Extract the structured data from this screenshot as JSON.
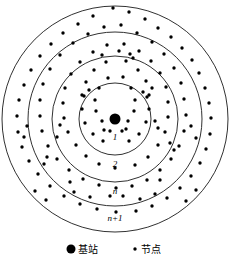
{
  "figure": {
    "title": "",
    "center": {
      "cx": 115,
      "cy": 119
    },
    "base_station": {
      "label": "base-station",
      "radius": 5.5,
      "color": "#000000"
    },
    "rings": [
      {
        "id": "ring-1",
        "radius": 36,
        "label": "1",
        "label_x": 115,
        "label_y": 140
      },
      {
        "id": "ring-2",
        "radius": 63,
        "label": "2",
        "label_x": 115,
        "label_y": 167
      },
      {
        "id": "ring-n",
        "radius": 87,
        "label": "n",
        "label_x": 115,
        "label_y": 194
      },
      {
        "id": "ring-n-plus-1",
        "radius": 113,
        "label": "n+1",
        "label_x": 115,
        "label_y": 221
      }
    ],
    "stroke_color": "#1a1a1a",
    "stroke_width": 0.9,
    "node": {
      "radius": 1.7,
      "color": "#000000"
    },
    "nodes": [
      [
        113,
        8
      ],
      [
        129,
        12
      ],
      [
        93,
        16
      ],
      [
        145,
        19
      ],
      [
        78,
        24
      ],
      [
        158,
        28
      ],
      [
        63,
        33
      ],
      [
        171,
        37
      ],
      [
        51,
        44
      ],
      [
        182,
        48
      ],
      [
        40,
        56
      ],
      [
        192,
        60
      ],
      [
        31,
        70
      ],
      [
        199,
        73
      ],
      [
        24,
        85
      ],
      [
        205,
        88
      ],
      [
        19,
        100
      ],
      [
        209,
        103
      ],
      [
        17,
        116
      ],
      [
        211,
        118
      ],
      [
        18,
        132
      ],
      [
        210,
        134
      ],
      [
        22,
        147
      ],
      [
        206,
        149
      ],
      [
        29,
        161
      ],
      [
        200,
        163
      ],
      [
        38,
        174
      ],
      [
        191,
        176
      ],
      [
        50,
        186
      ],
      [
        180,
        188
      ],
      [
        64,
        196
      ],
      [
        167,
        198
      ],
      [
        80,
        204
      ],
      [
        152,
        206
      ],
      [
        97,
        209
      ],
      [
        136,
        211
      ],
      [
        116,
        212
      ],
      [
        104,
        27
      ],
      [
        121,
        25
      ],
      [
        88,
        34
      ],
      [
        137,
        33
      ],
      [
        73,
        43
      ],
      [
        152,
        42
      ],
      [
        60,
        55
      ],
      [
        164,
        54
      ],
      [
        50,
        69
      ],
      [
        174,
        68
      ],
      [
        43,
        84
      ],
      [
        181,
        83
      ],
      [
        40,
        100
      ],
      [
        184,
        99
      ],
      [
        40,
        116
      ],
      [
        186,
        115
      ],
      [
        42,
        131
      ],
      [
        184,
        131
      ],
      [
        48,
        146
      ],
      [
        179,
        146
      ],
      [
        57,
        159
      ],
      [
        171,
        159
      ],
      [
        69,
        170
      ],
      [
        160,
        170
      ],
      [
        83,
        179
      ],
      [
        147,
        180
      ],
      [
        99,
        185
      ],
      [
        132,
        186
      ],
      [
        116,
        188
      ],
      [
        107,
        45
      ],
      [
        124,
        44
      ],
      [
        93,
        52
      ],
      [
        139,
        51
      ],
      [
        80,
        62
      ],
      [
        151,
        61
      ],
      [
        71,
        74
      ],
      [
        160,
        73
      ],
      [
        65,
        88
      ],
      [
        166,
        87
      ],
      [
        63,
        103
      ],
      [
        168,
        102
      ],
      [
        64,
        118
      ],
      [
        168,
        117
      ],
      [
        68,
        132
      ],
      [
        165,
        132
      ],
      [
        76,
        145
      ],
      [
        158,
        145
      ],
      [
        86,
        156
      ],
      [
        148,
        157
      ],
      [
        99,
        164
      ],
      [
        135,
        165
      ],
      [
        115,
        168
      ],
      [
        106,
        62
      ],
      [
        126,
        61
      ],
      [
        94,
        70
      ],
      [
        138,
        70
      ],
      [
        86,
        82
      ],
      [
        146,
        81
      ],
      [
        82,
        95
      ],
      [
        149,
        95
      ],
      [
        82,
        109
      ],
      [
        149,
        109
      ],
      [
        85,
        123
      ],
      [
        146,
        122
      ],
      [
        93,
        134
      ],
      [
        139,
        134
      ],
      [
        103,
        141
      ],
      [
        129,
        141
      ],
      [
        108,
        78
      ],
      [
        123,
        77
      ],
      [
        99,
        88
      ],
      [
        131,
        88
      ],
      [
        95,
        100
      ],
      [
        135,
        100
      ],
      [
        96,
        111
      ],
      [
        134,
        111
      ],
      [
        102,
        121
      ],
      [
        128,
        121
      ],
      [
        110,
        131
      ],
      [
        122,
        131
      ],
      [
        104,
        130
      ],
      [
        126,
        129
      ],
      [
        143,
        92
      ],
      [
        147,
        97
      ],
      [
        152,
        88
      ],
      [
        89,
        90
      ],
      [
        84,
        96
      ],
      [
        130,
        54
      ],
      [
        133,
        58
      ],
      [
        119,
        51
      ],
      [
        102,
        55
      ],
      [
        155,
        121
      ],
      [
        158,
        128
      ],
      [
        60,
        125
      ],
      [
        57,
        137
      ],
      [
        170,
        143
      ],
      [
        174,
        150
      ],
      [
        47,
        157
      ],
      [
        44,
        164
      ],
      [
        191,
        126
      ],
      [
        196,
        138
      ],
      [
        27,
        126
      ],
      [
        24,
        137
      ],
      [
        110,
        196
      ],
      [
        123,
        196
      ],
      [
        140,
        199
      ],
      [
        155,
        194
      ],
      [
        90,
        197
      ],
      [
        74,
        192
      ],
      [
        160,
        180
      ],
      [
        70,
        182
      ],
      [
        35,
        191
      ],
      [
        196,
        190
      ],
      [
        46,
        200
      ],
      [
        186,
        201
      ]
    ]
  },
  "legend": {
    "items": [
      {
        "id": "legend-base-station",
        "marker": "large-dot",
        "dot_radius": 4.5,
        "label": "基站",
        "dot_x": 71,
        "dot_y": 249,
        "text_x": 78,
        "text_y": 253
      },
      {
        "id": "legend-node",
        "marker": "small-dot",
        "dot_radius": 1.7,
        "label": "节点",
        "dot_x": 135,
        "dot_y": 249,
        "text_x": 141,
        "text_y": 253
      }
    ]
  }
}
